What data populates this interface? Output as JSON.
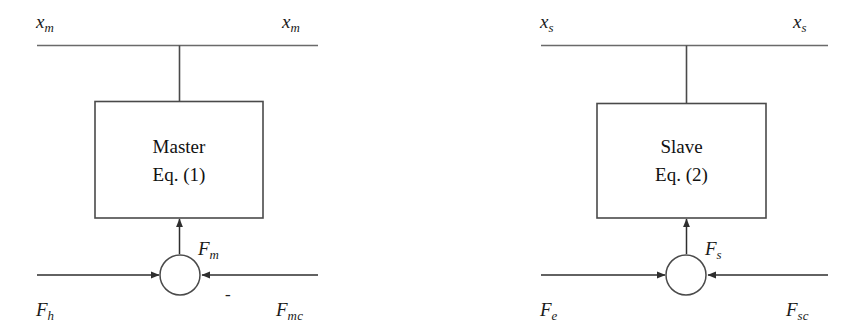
{
  "figure": {
    "type": "block-diagram",
    "background_color": "#ffffff",
    "line_color": "#3a3a3a",
    "text_color": "#111111"
  },
  "subsystems": [
    {
      "id": "master",
      "block": {
        "line1": "Master",
        "line2": "Eq. (1)"
      },
      "top_signal_left": {
        "base": "x",
        "sub": "m"
      },
      "top_signal_right": {
        "base": "x",
        "sub": "m"
      },
      "block_output_force": {
        "base": "F",
        "sub": "m"
      },
      "input_force_left": {
        "base": "F",
        "sub": "h"
      },
      "input_force_right": {
        "base": "F",
        "sub": "mc"
      },
      "summing_signs": {
        "left": "",
        "right": "-"
      }
    },
    {
      "id": "slave",
      "block": {
        "line1": "Slave",
        "line2": "Eq. (2)"
      },
      "top_signal_left": {
        "base": "x",
        "sub": "s"
      },
      "top_signal_right": {
        "base": "x",
        "sub": "s"
      },
      "block_output_force": {
        "base": "F",
        "sub": "s"
      },
      "input_force_left": {
        "base": "F",
        "sub": "e"
      },
      "input_force_right": {
        "base": "F",
        "sub": "sc"
      },
      "summing_signs": {
        "left": "",
        "right": ""
      }
    }
  ],
  "labels": {
    "left_top_left": "x",
    "left_top_left_sub": "m",
    "left_top_right": "x",
    "left_top_right_sub": "m",
    "left_block_line1": "Master",
    "left_block_line2": "Eq. (1)",
    "left_fm": "F",
    "left_fm_sub": "m",
    "left_fh": "F",
    "left_fh_sub": "h",
    "left_fmc": "F",
    "left_fmc_sub": "mc",
    "left_minus": "-",
    "right_top_left": "x",
    "right_top_left_sub": "s",
    "right_top_right": "x",
    "right_top_right_sub": "s",
    "right_block_line1": "Slave",
    "right_block_line2": "Eq. (2)",
    "right_fs": "F",
    "right_fs_sub": "s",
    "right_fe": "F",
    "right_fe_sub": "e",
    "right_fsc": "F",
    "right_fsc_sub": "sc"
  }
}
